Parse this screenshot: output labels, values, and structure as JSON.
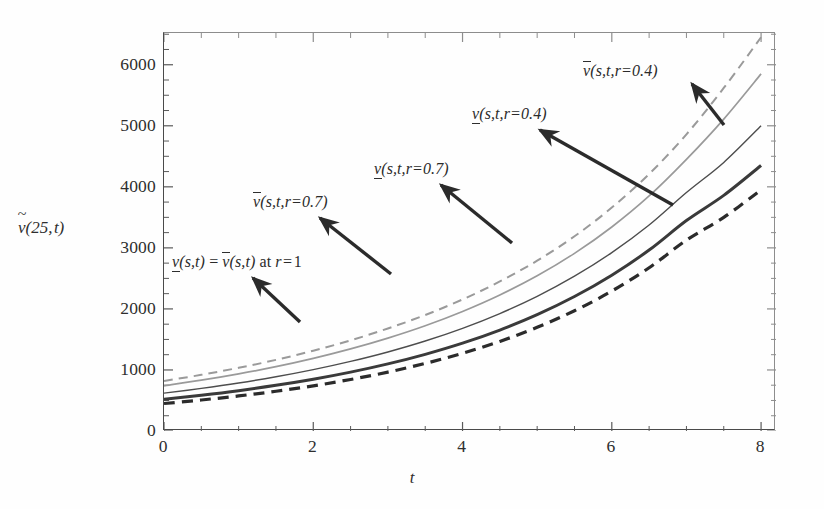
{
  "chart_data": {
    "type": "line",
    "title": "",
    "xlabel": "t",
    "ylabel": "ṽ(25, t)",
    "xlim": [
      0,
      8.2
    ],
    "ylim": [
      0,
      6520
    ],
    "grid": false,
    "legend_position": "inline-annotations",
    "x_ticks": [
      0,
      2,
      4,
      6,
      8
    ],
    "x_tick_labels": [
      "0",
      "2",
      "4",
      "6",
      "8"
    ],
    "y_ticks": [
      0,
      1000,
      2000,
      3000,
      4000,
      5000,
      6000
    ],
    "y_tick_labels": [
      "0",
      "1000",
      "2000",
      "3000",
      "4000",
      "5000",
      "6000"
    ],
    "x_minor_tick_step": 0.5,
    "y_minor_tick_step": 250,
    "x": [
      0,
      0.5,
      1,
      1.5,
      2,
      2.5,
      3,
      3.5,
      4,
      4.5,
      5,
      5.5,
      6,
      6.5,
      7,
      7.5,
      8
    ],
    "series": [
      {
        "name": "v̄(s,t,r=0.4)",
        "label": "upper-r04",
        "style": "dashed",
        "color": "#9a9a9a",
        "width": 2.0,
        "values": [
          820,
          920,
          1035,
          1165,
          1315,
          1485,
          1680,
          1900,
          2155,
          2450,
          2790,
          3190,
          3660,
          4210,
          4860,
          5620,
          6450
        ]
      },
      {
        "name": "v̄(s,t,r=0.7)",
        "label": "upper-r07",
        "style": "solid",
        "color": "#9a9a9a",
        "width": 1.7,
        "values": [
          740,
          832,
          936,
          1054,
          1190,
          1345,
          1522,
          1724,
          1958,
          2228,
          2542,
          2910,
          3342,
          3850,
          4450,
          5110,
          5850
        ]
      },
      {
        "name": "v̲(s,t) = v̄(s,t) at r = 1",
        "label": "center-r1",
        "style": "solid",
        "color": "#4d4d4d",
        "width": 1.4,
        "values": [
          620,
          698,
          786,
          888,
          1005,
          1140,
          1295,
          1474,
          1682,
          1924,
          2206,
          2536,
          2922,
          3374,
          3906,
          4400,
          5000
        ]
      },
      {
        "name": "v̲(s,t,r=0.7)",
        "label": "lower-r07",
        "style": "solid",
        "color": "#3a3a3a",
        "width": 3.0,
        "values": [
          520,
          586,
          661,
          748,
          848,
          964,
          1099,
          1256,
          1439,
          1654,
          1906,
          2203,
          2552,
          2964,
          3448,
          3860,
          4350
        ]
      },
      {
        "name": "v̲(s,t,r=0.4)",
        "label": "lower-r04",
        "style": "dashed",
        "color": "#2b2b2b",
        "width": 3.2,
        "values": [
          450,
          508,
          574,
          651,
          740,
          844,
          965,
          1107,
          1273,
          1468,
          1698,
          1970,
          2292,
          2674,
          3127,
          3500,
          3950
        ]
      }
    ],
    "annotations": [
      {
        "id": "annot-center-r1",
        "text": "v̲(s,t) = v̄(s,t) at r = 1",
        "text_x": 172,
        "text_y": 253,
        "arrow_from_x": 300,
        "arrow_from_y": 322,
        "arrow_to_x": 253,
        "arrow_to_y": 278
      },
      {
        "id": "annot-upper-r07",
        "text": "v̄(s,t,r=0.7)",
        "text_x": 253,
        "text_y": 193,
        "arrow_from_x": 391,
        "arrow_from_y": 274,
        "arrow_to_x": 320,
        "arrow_to_y": 218
      },
      {
        "id": "annot-lower-r07",
        "text": "v̲(s,t,r=0.7)",
        "text_x": 374,
        "text_y": 160,
        "arrow_from_x": 512,
        "arrow_from_y": 243,
        "arrow_to_x": 441,
        "arrow_to_y": 185
      },
      {
        "id": "annot-lower-r04",
        "text": "v̲(s,t,r=0.4)",
        "text_x": 472,
        "text_y": 105,
        "arrow_from_x": 673,
        "arrow_from_y": 205,
        "arrow_to_x": 540,
        "arrow_to_y": 130
      },
      {
        "id": "annot-upper-r04",
        "text": "v̄(s,t,r=0.4)",
        "text_x": 583,
        "text_y": 62,
        "arrow_from_x": 724,
        "arrow_from_y": 125,
        "arrow_to_x": 692,
        "arrow_to_y": 84
      }
    ]
  },
  "axis": {
    "y_title_parts": {
      "v": "v",
      "rest": "(25, t)"
    },
    "x_title": "t"
  }
}
